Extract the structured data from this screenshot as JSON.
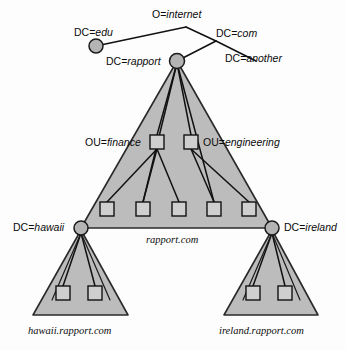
{
  "diagram": {
    "colors": {
      "triangle_fill": "#bcbcbc",
      "circle_fill": "#b4b4b4",
      "square_fill": "#cfcfcf",
      "stroke": "#111111",
      "background": "#fdfdfd"
    },
    "labels": {
      "org_internet": "O=internet",
      "dc_edu": "DC=edu",
      "dc_com": "DC=com",
      "dc_another": "DC=another",
      "dc_rapport": "DC=rapport",
      "ou_finance": "OU=finance",
      "ou_engineering": "OU=engineering",
      "dc_hawaii": "DC=hawaii",
      "dc_ireland": "DC=ireland",
      "domain_rapport": "rapport.com",
      "domain_hawaii": "hawaii.rapport.com",
      "domain_ireland": "ireland.rapport.com"
    },
    "nodes": [
      {
        "id": "edu",
        "type": "circle",
        "label": "DC=edu",
        "x": 96,
        "y": 46
      },
      {
        "id": "rapport",
        "type": "circle",
        "label": "DC=rapport",
        "x": 177,
        "y": 61
      },
      {
        "id": "finance",
        "type": "square",
        "label": "OU=finance",
        "x": 157,
        "y": 142
      },
      {
        "id": "engineering",
        "type": "square",
        "label": "OU=engineering",
        "x": 191,
        "y": 142
      },
      {
        "id": "leaf1",
        "type": "square",
        "label": "",
        "x": 107,
        "y": 209
      },
      {
        "id": "leaf2",
        "type": "square",
        "label": "",
        "x": 143,
        "y": 209
      },
      {
        "id": "leaf3",
        "type": "square",
        "label": "",
        "x": 179,
        "y": 209
      },
      {
        "id": "leaf4",
        "type": "square",
        "label": "",
        "x": 214,
        "y": 209
      },
      {
        "id": "leaf5",
        "type": "square",
        "label": "",
        "x": 249,
        "y": 209
      },
      {
        "id": "hawaii",
        "type": "circle",
        "label": "DC=hawaii",
        "x": 81,
        "y": 228
      },
      {
        "id": "ireland",
        "type": "circle",
        "label": "DC=ireland",
        "x": 272,
        "y": 228
      },
      {
        "id": "hawaii-leaf1",
        "type": "square",
        "label": "",
        "x": 63,
        "y": 293
      },
      {
        "id": "hawaii-leaf2",
        "type": "square",
        "label": "",
        "x": 95,
        "y": 293
      },
      {
        "id": "ireland-leaf1",
        "type": "square",
        "label": "",
        "x": 253,
        "y": 293
      },
      {
        "id": "ireland-leaf2",
        "type": "square",
        "label": "",
        "x": 285,
        "y": 293
      }
    ],
    "triangles": [
      {
        "id": "rapport-domain",
        "label": "rapport.com",
        "apex_x": 177,
        "apex_y": 61,
        "left_x": 81,
        "right_x": 272,
        "base_y": 228
      },
      {
        "id": "hawaii-domain",
        "label": "hawaii.rapport.com",
        "apex_x": 81,
        "apex_y": 230,
        "left_x": 33,
        "right_x": 128,
        "base_y": 315
      },
      {
        "id": "ireland-domain",
        "label": "ireland.rapport.com",
        "apex_x": 272,
        "apex_y": 230,
        "left_x": 224,
        "right_x": 318,
        "base_y": 315
      }
    ]
  }
}
